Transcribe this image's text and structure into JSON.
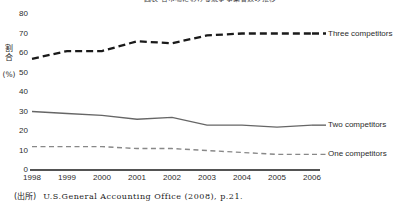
{
  "chart_data": {
    "type": "line",
    "title": "図表 各市場における競争事業者数の推移",
    "xlabel": "",
    "ylabel": "割合（％）",
    "x": [
      1998,
      1999,
      2000,
      2001,
      2002,
      2003,
      2004,
      2005,
      2006
    ],
    "xticklabels": [
      "1998",
      "1999",
      "2000",
      "2001",
      "2002",
      "2003",
      "2004",
      "2005",
      "2006"
    ],
    "yticklabels": [
      "0",
      "10",
      "20",
      "30",
      "40",
      "50",
      "60",
      "70",
      "80"
    ],
    "ylim": [
      0,
      80
    ],
    "ytick_step": 10,
    "grid": false,
    "legend_position": "right-inline",
    "series": [
      {
        "name": "Three competitors",
        "label": "Three competitors",
        "style": "dashed-bold",
        "color": "#1a1a1a",
        "values": [
          57,
          61,
          61,
          66,
          65,
          69,
          70,
          70,
          70
        ]
      },
      {
        "name": "Two competitors",
        "label": "Two competitors",
        "style": "solid",
        "color": "#666666",
        "values": [
          30,
          29,
          28,
          26,
          27,
          23,
          23,
          22,
          23
        ]
      },
      {
        "name": "One competitors",
        "label": "One competitors",
        "style": "dashed-thin",
        "color": "#888888",
        "values": [
          12,
          12,
          12,
          11,
          11,
          10,
          9,
          8,
          8
        ]
      }
    ]
  },
  "yaxis": {
    "cjk_caption": "割合",
    "percent_caption": "(%)"
  },
  "source": {
    "tag": "(出所)",
    "text": "U.S.General Accounting Office (2008), p.21."
  }
}
